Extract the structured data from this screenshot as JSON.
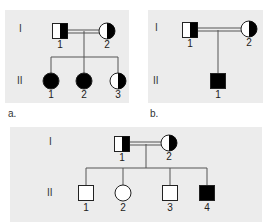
{
  "colors": {
    "panel_bg": "#ececec",
    "line": "#555555",
    "affected": "#000000",
    "unaffected": "#ffffff"
  },
  "panels": [
    {
      "caption": "a.",
      "generations": [
        "I",
        "II"
      ],
      "parents": {
        "father": {
          "label": "1",
          "sex": "male",
          "status": "carrier-half-filled-right"
        },
        "mother": {
          "label": "2",
          "sex": "female",
          "status": "carrier-half-filled-right"
        },
        "consanguineous": true
      },
      "children": [
        {
          "label": "1",
          "sex": "female",
          "status": "affected"
        },
        {
          "label": "2",
          "sex": "female",
          "status": "affected"
        },
        {
          "label": "3",
          "sex": "female",
          "status": "carrier-half-filled-right"
        }
      ]
    },
    {
      "caption": "b.",
      "generations": [
        "I",
        "II"
      ],
      "parents": {
        "father": {
          "label": "1",
          "sex": "male",
          "status": "carrier-half-filled-right"
        },
        "mother": {
          "label": "2",
          "sex": "female",
          "status": "carrier-half-filled-right"
        },
        "consanguineous": true
      },
      "children": [
        {
          "label": "1",
          "sex": "male",
          "status": "affected"
        }
      ]
    },
    {
      "caption": "",
      "generations": [
        "I",
        "II"
      ],
      "parents": {
        "father": {
          "label": "1",
          "sex": "male",
          "status": "carrier-half-filled-right"
        },
        "mother": {
          "label": "2",
          "sex": "female",
          "status": "carrier-half-filled-right"
        },
        "consanguineous": true
      },
      "children": [
        {
          "label": "1",
          "sex": "male",
          "status": "unaffected"
        },
        {
          "label": "2",
          "sex": "female",
          "status": "unaffected"
        },
        {
          "label": "3",
          "sex": "male",
          "status": "unaffected"
        },
        {
          "label": "4",
          "sex": "male",
          "status": "affected"
        }
      ]
    }
  ]
}
